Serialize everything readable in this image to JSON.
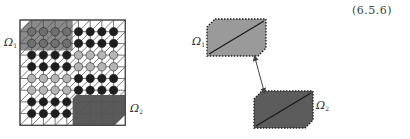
{
  "equation_number": "(6.5.6)",
  "left_diagram": {
    "grid": {
      "x": 20,
      "y": 20,
      "cells": 9,
      "cell_size": 11.7
    },
    "labels": [
      {
        "id": "omega1",
        "symbol": "Ω",
        "subscript": "1",
        "x": 4,
        "y": 37
      },
      {
        "id": "omega2",
        "symbol": "Ω",
        "subscript": "2",
        "x": 130,
        "y": 103
      }
    ],
    "node_rows": [
      [
        "mid",
        "mid",
        "mid",
        "mid",
        "dark",
        "dark",
        "dark",
        "dark"
      ],
      [
        "mid",
        "mid",
        "mid",
        "mid",
        "dark",
        "dark",
        "dark",
        "dark"
      ],
      [
        "dark",
        "dark",
        "dark",
        "dark",
        "light",
        "light",
        "light",
        "light"
      ],
      [
        "dark",
        "dark",
        "dark",
        "dark",
        "light",
        "light",
        "light",
        "light"
      ],
      [
        "light",
        "light",
        "light",
        "light",
        "dark",
        "dark",
        "dark",
        "dark"
      ],
      [
        "light",
        "light",
        "light",
        "light",
        "dark",
        "dark",
        "dark",
        "dark"
      ],
      [
        "dark",
        "dark",
        "dark",
        "dark",
        "none",
        "none",
        "none",
        "none"
      ],
      [
        "dark",
        "dark",
        "dark",
        "dark",
        "none",
        "none",
        "none",
        "none"
      ]
    ],
    "colors": {
      "omega1_fill": "#8a8a8a",
      "omega2_fill": "#5a5a5a",
      "node_dark": "#1e1e1e",
      "node_mid": "#707070",
      "node_light": "#b5b5b5",
      "grid_line": "#555555"
    }
  },
  "right_diagram": {
    "labels": [
      {
        "id": "omega1",
        "symbol": "Ω",
        "subscript": "1",
        "x": 192,
        "y": 36
      },
      {
        "id": "omega2",
        "symbol": "Ω",
        "subscript": "2",
        "x": 316,
        "y": 100
      }
    ],
    "shapes": [
      {
        "id": "omega1-block",
        "x": 207,
        "y": 19,
        "w": 59,
        "h": 37,
        "fill": "#9a9a9a"
      },
      {
        "id": "omega2-block",
        "x": 254,
        "y": 91,
        "w": 59,
        "h": 37,
        "fill": "#5c5c5c"
      }
    ],
    "connector": {
      "x1": 255,
      "y1": 58,
      "x2": 264,
      "y2": 91
    }
  }
}
